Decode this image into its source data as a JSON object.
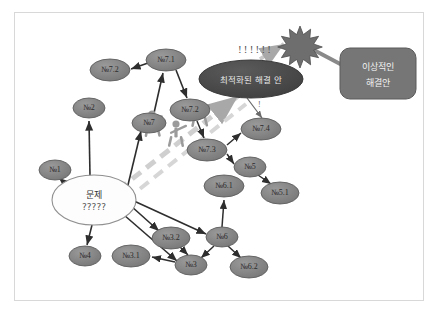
{
  "diagram": {
    "title_present": false,
    "frame": {
      "border_color": "#d8d8d8",
      "background": "#ffffff"
    },
    "palette": {
      "node_fill": "#7d7d7d",
      "node_stroke": "#5e5e5e",
      "center_fill": "#fdfdfd",
      "center_stroke": "#909090",
      "dark_ellipse_fill": "#4a4a4a",
      "rounded_box_fill": "#767676",
      "rounded_box_stroke": "#5a5a5a",
      "arrow_dark": "#2e2e2e",
      "arrow_dashed": "#c9c9c9",
      "figure_fill": "#9b9b9b",
      "starburst_fill": "#6e6e6e",
      "label_text": "#2b2b2b",
      "light_text": "#efefef"
    },
    "center_node": {
      "label_main": "문제",
      "label_sub": "?????"
    },
    "dark_ellipse": {
      "label": "최적화된 해결 안"
    },
    "rounded_box": {
      "line1": "이상적인",
      "line2": "해결안"
    },
    "annotations": {
      "exclamations_top": "!!!!!!",
      "exclamation_small": "!"
    },
    "nodes": [
      {
        "id": "n7_2a",
        "label": "№7.2",
        "cx": 110,
        "cy": 70,
        "rx": 20,
        "ry": 11
      },
      {
        "id": "n7_1",
        "label": "№7.1",
        "cx": 166,
        "cy": 60,
        "rx": 20,
        "ry": 11
      },
      {
        "id": "n2",
        "label": "№2",
        "cx": 89,
        "cy": 108,
        "rx": 16,
        "ry": 10
      },
      {
        "id": "n7",
        "label": "№7",
        "cx": 149,
        "cy": 123,
        "rx": 17,
        "ry": 10
      },
      {
        "id": "n7_2b",
        "label": "№7.2",
        "cx": 190,
        "cy": 110,
        "rx": 20,
        "ry": 11
      },
      {
        "id": "n7_3",
        "label": "№7.3",
        "cx": 207,
        "cy": 150,
        "rx": 20,
        "ry": 11
      },
      {
        "id": "n7_4",
        "label": "№7.4",
        "cx": 261,
        "cy": 129,
        "rx": 20,
        "ry": 11
      },
      {
        "id": "n1",
        "label": "№1",
        "cx": 55,
        "cy": 170,
        "rx": 16,
        "ry": 10
      },
      {
        "id": "n5",
        "label": "№5",
        "cx": 250,
        "cy": 167,
        "rx": 16,
        "ry": 10
      },
      {
        "id": "n6_1",
        "label": "№6.1",
        "cx": 224,
        "cy": 186,
        "rx": 20,
        "ry": 11
      },
      {
        "id": "n5_1",
        "label": "№5.1",
        "cx": 280,
        "cy": 193,
        "rx": 19,
        "ry": 11
      },
      {
        "id": "n4",
        "label": "№4",
        "cx": 85,
        "cy": 256,
        "rx": 16,
        "ry": 10
      },
      {
        "id": "n3_1",
        "label": "№3.1",
        "cx": 131,
        "cy": 256,
        "rx": 19,
        "ry": 11
      },
      {
        "id": "n3_2",
        "label": "№3.2",
        "cx": 171,
        "cy": 238,
        "rx": 19,
        "ry": 11
      },
      {
        "id": "n3",
        "label": "№3",
        "cx": 191,
        "cy": 265,
        "rx": 16,
        "ry": 10
      },
      {
        "id": "n6",
        "label": "№6",
        "cx": 222,
        "cy": 237,
        "rx": 16,
        "ry": 10
      },
      {
        "id": "n6_2",
        "label": "№6.2",
        "cx": 249,
        "cy": 267,
        "rx": 19,
        "ry": 11
      }
    ],
    "center": {
      "cx": 94,
      "cy": 200,
      "rx": 42,
      "ry": 25
    },
    "dark_ellipse_geom": {
      "cx": 251,
      "cy": 79,
      "rx": 52,
      "ry": 19
    },
    "box_geom": {
      "x": 340,
      "y": 48,
      "w": 76,
      "h": 51,
      "r": 10
    },
    "starburst": {
      "cx": 300,
      "cy": 41,
      "r_outer": 15,
      "r_inner": 7,
      "points": 11
    },
    "figures": [
      {
        "x": 152,
        "y": 118,
        "scale": 1.0
      },
      {
        "x": 174,
        "y": 126,
        "scale": 1.0
      },
      {
        "x": 196,
        "y": 107,
        "scale": 0.95
      }
    ],
    "edges": [
      {
        "from": "n7_1",
        "to": "n7_2a",
        "type": "solid"
      },
      {
        "from": "n7_1",
        "to": "n7_2b",
        "type": "solid"
      },
      {
        "from": "n7",
        "to": "n7_1",
        "type": "solid"
      },
      {
        "from": "n7_2b",
        "to": "n7_3",
        "type": "solid"
      },
      {
        "from": "n7_3",
        "to": "n7_4",
        "type": "solid"
      },
      {
        "from": "n7_3",
        "to": "n5",
        "type": "solid"
      },
      {
        "from": "n5",
        "to": "n5_1",
        "type": "solid"
      },
      {
        "from": "n6",
        "to": "n6_1",
        "type": "solid"
      },
      {
        "from": "n6",
        "to": "n6_2",
        "type": "solid"
      },
      {
        "from": "n3_2",
        "to": "n3",
        "type": "solid"
      },
      {
        "from": "n3",
        "to": "n3_1",
        "type": "solid"
      },
      {
        "from": "n6",
        "to": "n3",
        "type": "solid"
      },
      {
        "from": "center",
        "to": "n1",
        "type": "solid"
      },
      {
        "from": "center",
        "to": "n2",
        "type": "solid"
      },
      {
        "from": "center",
        "to": "n7",
        "type": "solid"
      },
      {
        "from": "center",
        "to": "n3_2",
        "type": "solid"
      },
      {
        "from": "center",
        "to": "n6",
        "type": "solid"
      },
      {
        "from": "center",
        "to": "n3",
        "type": "solid"
      },
      {
        "from": "center",
        "to": "n4",
        "type": "solid"
      },
      {
        "from": "center",
        "to": "dark_ellipse",
        "type": "dashed"
      },
      {
        "from": "dark_ellipse",
        "to": "starburst",
        "type": "dashed"
      },
      {
        "from": "starburst",
        "to": "box",
        "type": "solid-thick"
      },
      {
        "from": "dark_ellipse",
        "to": "n7_4",
        "type": "solid-thin"
      }
    ]
  }
}
